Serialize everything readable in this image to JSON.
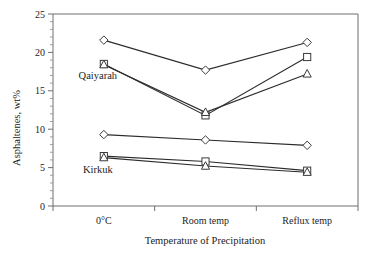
{
  "chart_data": {
    "type": "line",
    "title": "",
    "xlabel": "Temperature of Precipitation",
    "ylabel": "Asphaltenes, wt%",
    "categories": [
      "0°C",
      "Room temp",
      "Reflux temp"
    ],
    "ylim": [
      0,
      25
    ],
    "yticks": [
      0,
      5,
      10,
      15,
      20,
      25
    ],
    "ytick_labels": [
      "0",
      "5",
      "10",
      "15",
      "20",
      "25"
    ],
    "y_minor_tick_step": 1,
    "grid": false,
    "legend_position": "inline-annotation",
    "annotations": [
      {
        "text": "Qaiyarah",
        "x_category": "0°C",
        "y_value": 16.6
      },
      {
        "text": "Kirkuk",
        "x_category": "0°C",
        "y_value": 4.3
      }
    ],
    "groups": [
      {
        "name": "Qaiyarah",
        "series": [
          {
            "name": "Qaiyarah diamond",
            "marker": "diamond",
            "values": [
              21.6,
              17.7,
              21.3
            ]
          },
          {
            "name": "Qaiyarah square",
            "marker": "square",
            "values": [
              18.5,
              11.8,
              19.4
            ]
          },
          {
            "name": "Qaiyarah triangle",
            "marker": "triangle",
            "values": [
              18.4,
              12.2,
              17.2
            ]
          }
        ]
      },
      {
        "name": "Kirkuk",
        "series": [
          {
            "name": "Kirkuk diamond",
            "marker": "diamond",
            "values": [
              9.3,
              8.6,
              7.9
            ]
          },
          {
            "name": "Kirkuk square",
            "marker": "square",
            "values": [
              6.5,
              5.8,
              4.6
            ]
          },
          {
            "name": "Kirkuk triangle",
            "marker": "triangle",
            "values": [
              6.3,
              5.2,
              4.4
            ]
          }
        ]
      }
    ],
    "series": [
      {
        "name": "Qaiyarah diamond",
        "marker": "diamond",
        "values": [
          21.6,
          17.7,
          21.3
        ]
      },
      {
        "name": "Qaiyarah square",
        "marker": "square",
        "values": [
          18.5,
          11.8,
          19.4
        ]
      },
      {
        "name": "Qaiyarah triangle",
        "marker": "triangle",
        "values": [
          18.4,
          12.2,
          17.2
        ]
      },
      {
        "name": "Kirkuk diamond",
        "marker": "diamond",
        "values": [
          9.3,
          8.6,
          7.9
        ]
      },
      {
        "name": "Kirkuk square",
        "marker": "square",
        "values": [
          6.5,
          5.8,
          4.6
        ]
      },
      {
        "name": "Kirkuk triangle",
        "marker": "triangle",
        "values": [
          6.3,
          5.2,
          4.4
        ]
      }
    ],
    "colors": {
      "line": "#2b2b2b",
      "marker_fill": "#ffffff",
      "marker_stroke": "#3a3a3a",
      "axis": "#6f6f6f",
      "text": "#232323",
      "background": "#ffffff"
    }
  }
}
